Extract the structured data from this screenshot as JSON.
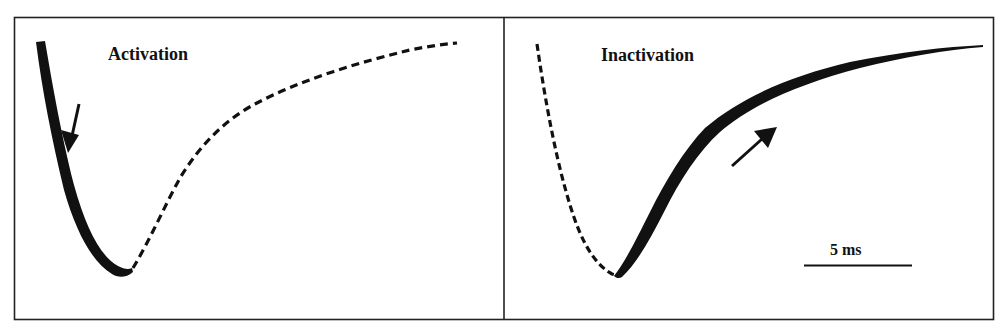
{
  "figure": {
    "colors": {
      "ink": "#111111",
      "frame": "#222222",
      "background": "#ffffff"
    },
    "panels": [
      {
        "id": "activation",
        "label": "Activation",
        "arrow_direction": "down",
        "solid_segment": "descending phase (thick band)",
        "dashed_segment": "rising phase"
      },
      {
        "id": "inactivation",
        "label": "Inactivation",
        "arrow_direction": "up-right",
        "solid_segment": "rising phase (thick band)",
        "dashed_segment": "descending phase"
      }
    ],
    "scale_bar": {
      "label": "5 ms"
    }
  }
}
